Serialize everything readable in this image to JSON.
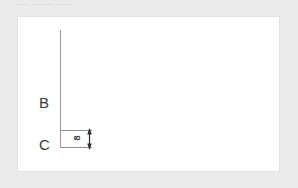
{
  "caption": {
    "text": "—— ——— —— ——"
  },
  "figure": {
    "title": "",
    "background_color": "#ffffff",
    "page_background_color": "#ebebeb",
    "line_color": "#9a9a9a",
    "text_color": "#3a3a3a",
    "labels": [
      {
        "id": "b",
        "text": "B"
      },
      {
        "id": "c",
        "text": "C"
      }
    ],
    "dimension": {
      "value": "8",
      "orientation": "vertical",
      "arrowheads": "both",
      "extension_lines": 2
    },
    "axis": {
      "name": "vertical-axis",
      "orientation": "vertical"
    }
  }
}
